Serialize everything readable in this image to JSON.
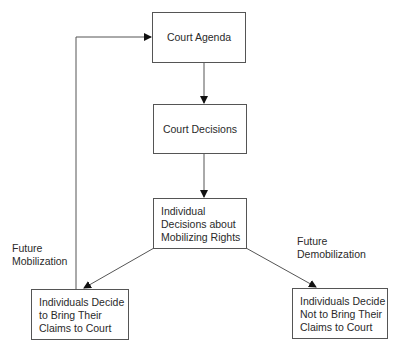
{
  "diagram": {
    "nodes": {
      "court_agenda": "Court Agenda",
      "court_decisions": "Court Decisions",
      "individual_decisions": [
        "Individual",
        "Decisions about",
        "Mobilizing Rights"
      ],
      "bring_claims": [
        "Individuals Decide",
        "to Bring Their",
        "Claims to Court"
      ],
      "not_bring_claims": [
        "Individuals Decide",
        "Not to Bring Their",
        "Claims to Court"
      ]
    },
    "edge_labels": {
      "future_mobilization": [
        "Future",
        "Mobilization"
      ],
      "future_demobilization": [
        "Future",
        "Demobilization"
      ]
    },
    "edges": [
      {
        "from": "court_agenda",
        "to": "court_decisions"
      },
      {
        "from": "court_decisions",
        "to": "individual_decisions"
      },
      {
        "from": "individual_decisions",
        "to": "bring_claims"
      },
      {
        "from": "individual_decisions",
        "to": "not_bring_claims"
      },
      {
        "from": "bring_claims",
        "to": "court_agenda",
        "label": "Future Mobilization"
      }
    ],
    "colors": {
      "line": "#555555",
      "text": "#2a2a2a"
    }
  }
}
